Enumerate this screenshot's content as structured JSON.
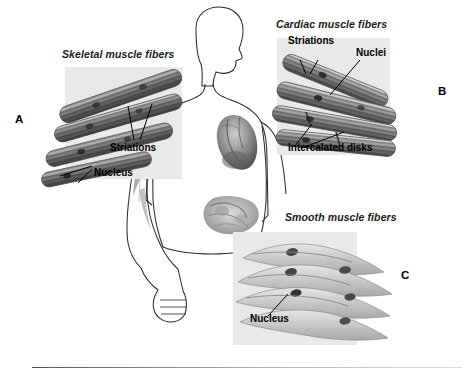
{
  "figure": {
    "title_visible": false,
    "background": "#ffffff",
    "panel_background": "#e9e9e9"
  },
  "panels": [
    {
      "key": "A",
      "name": "skeletal",
      "label": "Skeletal muscle fibers",
      "key_letter": "A",
      "annotations": [
        "Striations",
        "Nucleus"
      ]
    },
    {
      "key": "B",
      "name": "cardiac",
      "label": "Cardiac muscle fibers",
      "key_letter": "B",
      "annotations": [
        "Striations",
        "Nuclei",
        "Intercalated disks"
      ]
    },
    {
      "key": "C",
      "name": "smooth",
      "label": "Smooth muscle fibers",
      "key_letter": "C",
      "annotations": [
        "Nucleus"
      ]
    }
  ],
  "skeletal": {
    "label": "Skeletal muscle fibers",
    "key_letter": "A",
    "striations": "Striations",
    "nucleus": "Nucleus"
  },
  "cardiac": {
    "label": "Cardiac muscle fibers",
    "key_letter": "B",
    "striations": "Striations",
    "nuclei": "Nuclei",
    "intercalated": "Intercalated disks"
  },
  "smooth": {
    "label": "Smooth muscle fibers",
    "key_letter": "C",
    "nucleus": "Nucleus"
  },
  "body_figure": {
    "description": "human body outline",
    "organs": [
      "arm skeletal muscle",
      "heart",
      "intestines"
    ]
  }
}
